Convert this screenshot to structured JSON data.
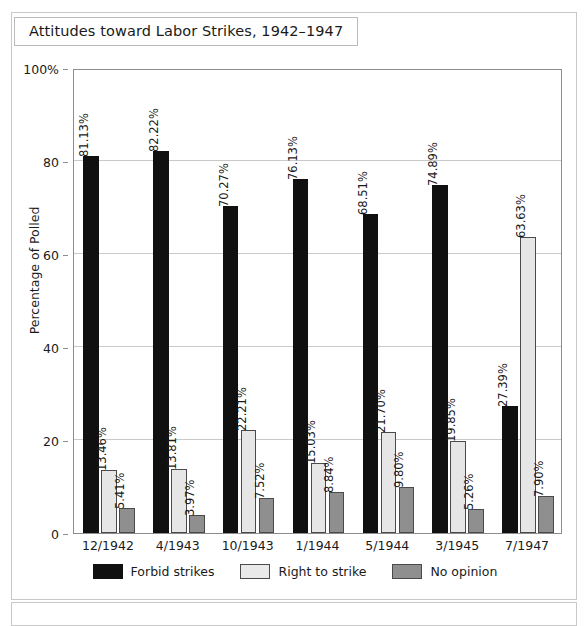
{
  "figure": {
    "title": "Attitudes toward Labor Strikes, 1942–1947"
  },
  "chart_data": {
    "type": "bar",
    "title": "Attitudes toward Labor Strikes, 1942–1947",
    "xlabel": "",
    "ylabel": "Percentage of Polled",
    "ylim": [
      0,
      100
    ],
    "yticks": [
      "0",
      "20",
      "40",
      "60",
      "80",
      "100%"
    ],
    "ytick_values": [
      0,
      20,
      40,
      60,
      80,
      100
    ],
    "grid": "horizontal",
    "legend_position": "bottom-center",
    "categories": [
      "12/1942",
      "4/1943",
      "10/1943",
      "1/1944",
      "5/1944",
      "3/1945",
      "7/1947"
    ],
    "series": [
      {
        "name": "Forbid strikes",
        "color": "#101010",
        "values": [
          81.13,
          82.22,
          70.27,
          76.13,
          68.51,
          74.89,
          27.39
        ],
        "labels": [
          "81.13%",
          "82.22%",
          "70.27%",
          "76.13%",
          "68.51%",
          "74.89%",
          "27.39%"
        ]
      },
      {
        "name": "Right to strike",
        "color": "#e6e6e6",
        "values": [
          13.46,
          13.81,
          22.21,
          15.03,
          21.7,
          19.85,
          63.63
        ],
        "labels": [
          "13.46%",
          "13.81%",
          "22.21%",
          "15.03%",
          "21.70%",
          "19.85%",
          "63.63%"
        ]
      },
      {
        "name": "No opinion",
        "color": "#8f8f8f",
        "values": [
          5.41,
          3.97,
          7.52,
          8.84,
          9.8,
          5.26,
          7.9
        ],
        "labels": [
          "5.41%",
          "3.97%",
          "7.52%",
          "8.84%",
          "9.80%",
          "5.26%",
          "7.90%"
        ]
      }
    ]
  }
}
